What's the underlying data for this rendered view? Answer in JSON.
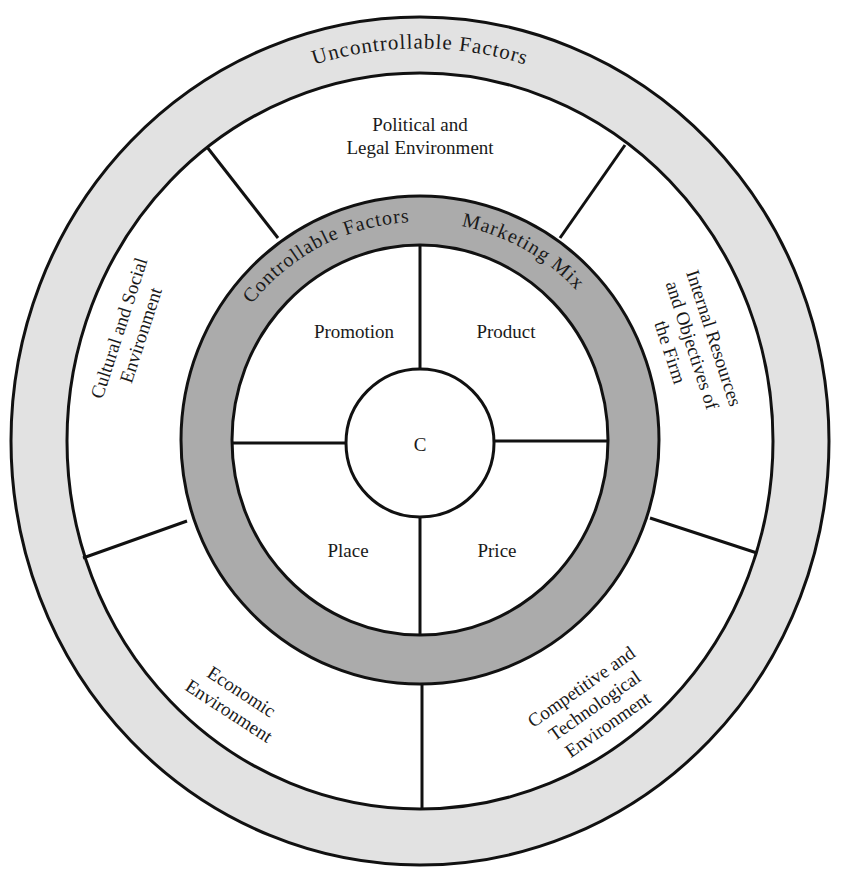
{
  "diagram": {
    "outer_ring_label": "Uncontrollable Factors",
    "inner_ring_label_left": "Controllable Factors",
    "inner_ring_label_right": "Marketing Mix",
    "center_label": "C",
    "marketing_mix": {
      "top_left": "Promotion",
      "top_right": "Product",
      "bottom_left": "Place",
      "bottom_right": "Price"
    },
    "environments": {
      "top": [
        "Political and",
        "Legal Environment"
      ],
      "left": [
        "Cultural and Social",
        "Environment"
      ],
      "right": [
        "Internal Resources",
        "and Objectives of",
        "the Firm"
      ],
      "bottom_left": [
        "Economic",
        "Environment"
      ],
      "bottom_right": [
        "Competitive and",
        "Technological",
        "Environment"
      ]
    },
    "colors": {
      "outer_ring_fill": "#e2e2e2",
      "inner_ring_fill": "#ababab",
      "stroke": "#111111",
      "background": "#ffffff"
    }
  }
}
